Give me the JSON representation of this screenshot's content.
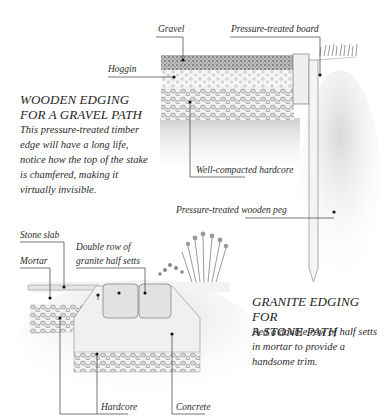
{
  "gravel_path": {
    "heading_lines": [
      "WOODEN EDGING",
      "FOR A GRAVEL PATH"
    ],
    "body_lines": [
      "This pressure-treated timber",
      "edge will have a long life,",
      "notice how the top of the stake",
      "is chamfered, making it",
      "virtually invisible."
    ],
    "labels": {
      "gravel": "Gravel",
      "board": "Pressure-treated board",
      "hoggin": "Hoggin",
      "hardcore": "Well-compacted hardcore",
      "peg": "Pressure-treated wooden peg"
    }
  },
  "stone_path": {
    "heading_lines": [
      "GRANITE EDGING FOR",
      "A STONE PATH"
    ],
    "body_lines": [
      "Bed a double row of half setts",
      "in mortar to provide a",
      "handsome trim."
    ],
    "labels": {
      "stone_slab": "Stone slab",
      "mortar": "Mortar",
      "setts_line1": "Double row of",
      "setts_line2": "granite half setts",
      "hardcore": "Hardcore",
      "concrete": "Concrete"
    }
  },
  "colors": {
    "ink": "#2b2b2b",
    "soil": "#d6d6d6",
    "gravel": "#8a8a8a",
    "paper": "#ffffff"
  }
}
